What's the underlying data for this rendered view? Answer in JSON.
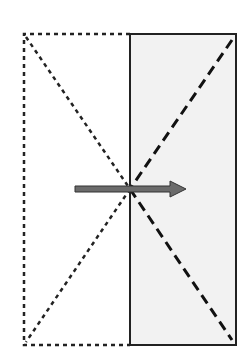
{
  "diagram": {
    "width": 252,
    "height": 359,
    "colors": {
      "background": "#ffffff",
      "shaded_fill": "#f2f2f2",
      "stroke": "#222222",
      "arrow_fill": "#6b6b6b",
      "arrow_stroke": "#333333"
    },
    "dotted_rect": {
      "x1": 24,
      "y1": 34,
      "x2": 130,
      "y2": 345
    },
    "solid_rect": {
      "x1": 130,
      "y1": 34,
      "x2": 236,
      "y2": 345
    },
    "dotted_diagonals": [
      {
        "x1": 26,
        "y1": 37,
        "x2": 130,
        "y2": 189
      },
      {
        "x1": 130,
        "y1": 189,
        "x2": 26,
        "y2": 342
      }
    ],
    "dashed_diagonals": [
      {
        "x1": 232,
        "y1": 40,
        "x2": 130,
        "y2": 189
      },
      {
        "x1": 130,
        "y1": 189,
        "x2": 232,
        "y2": 340
      }
    ],
    "arrow": {
      "x1": 75,
      "y": 189,
      "x2": 186,
      "direction": "right"
    }
  }
}
